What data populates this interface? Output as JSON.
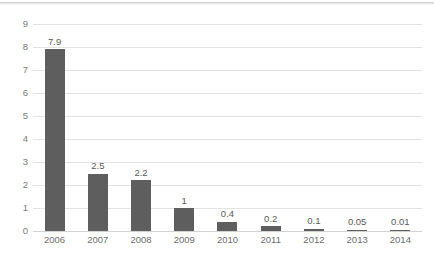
{
  "chart_data": {
    "type": "bar",
    "title": "",
    "subtitle": "",
    "xlabel": "",
    "ylabel": "",
    "categories": [
      "2006",
      "2007",
      "2008",
      "2009",
      "2010",
      "2011",
      "2012",
      "2013",
      "2014"
    ],
    "values": [
      7.9,
      2.5,
      2.2,
      1,
      0.4,
      0.2,
      0.1,
      0.05,
      0.01
    ],
    "value_labels": [
      "7.9",
      "2.5",
      "2.2",
      "1",
      "0.4",
      "0.2",
      "0.1",
      "0.05",
      "0.01"
    ],
    "ylim": [
      0,
      9
    ],
    "y_ticks": [
      0,
      1,
      2,
      3,
      4,
      5,
      6,
      7,
      8,
      9
    ],
    "y_tick_labels": [
      "0",
      "1",
      "2",
      "3",
      "4",
      "5",
      "6",
      "7",
      "8",
      "9"
    ],
    "grid": "horizontal",
    "legend": "none",
    "bar_color": "#5e5e5e",
    "gridline_color": "#e3e3e3",
    "axis_label_color": "#6d6d6d",
    "data_label_color": "#5a5a5a",
    "background_color": "#ffffff"
  }
}
